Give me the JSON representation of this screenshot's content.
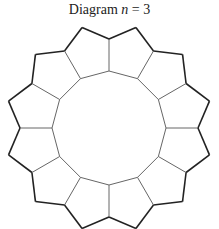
{
  "title": {
    "prefix": "Diagram ",
    "var": "n",
    "suffix": " = 3"
  },
  "diagram": {
    "center": [
      109,
      128
    ],
    "pentagon_count": 12,
    "inner_radius": 57,
    "outer_radius": 89,
    "peak_radius": 104,
    "outer_color": "#222222",
    "inner_color": "#666666"
  }
}
